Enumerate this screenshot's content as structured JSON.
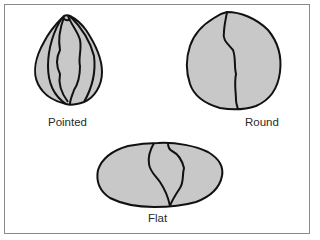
{
  "figure": {
    "fill_color": "#c8c8c8",
    "stroke_color": "#111111",
    "frame_color": "#8a8a8a",
    "items": [
      {
        "label": "Pointed",
        "shape": "pointed"
      },
      {
        "label": "Round",
        "shape": "round"
      },
      {
        "label": "Flat",
        "shape": "flat"
      }
    ]
  }
}
